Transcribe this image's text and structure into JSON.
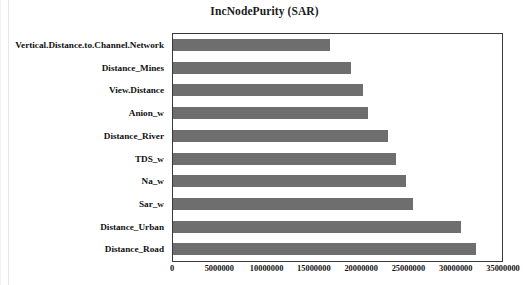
{
  "chart_data": {
    "type": "bar",
    "orientation": "horizontal",
    "title": "IncNodePurity (SAR)",
    "xlabel": "",
    "ylabel": "",
    "grid": false,
    "legend": null,
    "xlim": [
      0,
      35000000
    ],
    "xticks": [
      0,
      5000000,
      10000000,
      15000000,
      20000000,
      25000000,
      30000000,
      35000000
    ],
    "xtick_labels": [
      "0",
      "5000000",
      "10000000",
      "15000000",
      "20000000",
      "25000000",
      "30000000",
      "35000000"
    ],
    "bar_color": "#6e6e6e",
    "frame_color": "#3a3a3a",
    "background": "#ffffff",
    "categories": [
      "Vertical.Distance.to.Channel.Network",
      "Distance_Mines",
      "View.Distance",
      "Anion_w",
      "Distance_River",
      "TDS_w",
      "Na_w",
      "Sar_w",
      "Distance_Urban",
      "Distance_Road"
    ],
    "values": [
      16600000,
      18900000,
      20200000,
      20700000,
      22800000,
      23600000,
      24700000,
      25500000,
      30500000,
      32100000
    ]
  }
}
